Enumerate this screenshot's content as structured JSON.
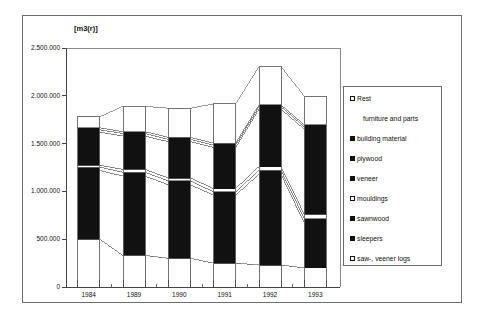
{
  "chart_data": {
    "type": "bar",
    "title": "",
    "subtitle": "",
    "xlabel": "",
    "ylabel": "[m3(r)]",
    "unit_label": "[m3(r)]",
    "categories": [
      "1984",
      "1989",
      "1990",
      "1991",
      "1992",
      "1993"
    ],
    "ylim": [
      0,
      2500000
    ],
    "ytick_values": [
      0,
      500000,
      1000000,
      1500000,
      2000000,
      2500000
    ],
    "ytick_labels": [
      "0",
      "500.000",
      "1.000.000",
      "1.500.000",
      "2.000.000",
      "2.500.000"
    ],
    "grid": false,
    "legend_position": "right",
    "stacked": true,
    "series": [
      {
        "name": "saw-, veener logs",
        "fill": "hollow",
        "values": [
          500000,
          330000,
          300000,
          250000,
          230000,
          200000
        ]
      },
      {
        "name": "sleepers",
        "fill": "filled",
        "values": [
          720000,
          830000,
          770000,
          710000,
          950000,
          470000
        ]
      },
      {
        "name": "sawnwood",
        "fill": "filled",
        "values": [
          35000,
          40000,
          40000,
          35000,
          40000,
          45000
        ]
      },
      {
        "name": "mouldings",
        "fill": "hollow",
        "values": [
          20000,
          30000,
          30000,
          35000,
          40000,
          45000
        ]
      },
      {
        "name": "veneer",
        "fill": "filled",
        "values": [
          345000,
          350000,
          380000,
          430000,
          600000,
          890000
        ]
      },
      {
        "name": "plywood",
        "fill": "filled",
        "values": [
          25000,
          25000,
          25000,
          25000,
          25000,
          25000
        ]
      },
      {
        "name": "building material",
        "fill": "filled",
        "values": [
          20000,
          20000,
          20000,
          20000,
          20000,
          20000
        ]
      },
      {
        "name": "Rest / furniture and parts",
        "fill": "hollow",
        "values": [
          115000,
          265000,
          305000,
          410000,
          400000,
          300000
        ]
      }
    ],
    "totals": [
      1780000,
      1890000,
      1870000,
      1915000,
      2305000,
      1995000
    ],
    "annotations": []
  },
  "legend": {
    "entries": [
      {
        "label": "Rest",
        "marker": "hollow",
        "indent": false
      },
      {
        "label": "furniture and parts",
        "marker": "none",
        "indent": true
      },
      {
        "label": "building material",
        "marker": "filled",
        "indent": false
      },
      {
        "label": "plywood",
        "marker": "filled",
        "indent": false
      },
      {
        "label": "veneer",
        "marker": "filled",
        "indent": false
      },
      {
        "label": "mouldings",
        "marker": "hollow",
        "indent": false
      },
      {
        "label": "sawnwood",
        "marker": "filled",
        "indent": false
      },
      {
        "label": "sleepers",
        "marker": "filled",
        "indent": false
      },
      {
        "label": "saw-, veener logs",
        "marker": "hollow",
        "indent": false
      }
    ]
  },
  "colors": {
    "filled": "#111111",
    "hollow": "#ffffff",
    "stroke": "#6e6e6e",
    "axis": "#444444",
    "text": "#111111",
    "frame": "#6e6e6e"
  }
}
